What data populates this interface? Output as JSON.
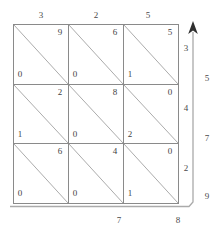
{
  "figure": {
    "type": "lattice-multiplication-grid",
    "rows": 3,
    "cols": 3
  },
  "colors": {
    "grid_line": "#8a8a8a",
    "diagonal_line": "#9a9a9a",
    "text": "#3f3f3f",
    "arrow": "#8a8a8a",
    "background": "#ffffff"
  },
  "top_labels": [
    "3",
    "2",
    "5"
  ],
  "right_inner_labels": [
    "3",
    "4",
    "2"
  ],
  "right_outer_labels": [
    "5",
    "7",
    "9"
  ],
  "bottom_labels": [
    "7",
    "8"
  ],
  "cells": [
    [
      {
        "upper": "9",
        "lower": "0"
      },
      {
        "upper": "6",
        "lower": "0"
      },
      {
        "upper": "5",
        "lower": "1"
      }
    ],
    [
      {
        "upper": "2",
        "lower": "1"
      },
      {
        "upper": "8",
        "lower": "0"
      },
      {
        "upper": "0",
        "lower": "2"
      }
    ],
    [
      {
        "upper": "6",
        "lower": "0"
      },
      {
        "upper": "4",
        "lower": "0"
      },
      {
        "upper": "0",
        "lower": "1"
      }
    ]
  ],
  "arrow": {
    "direction": "up",
    "label": "result-reading-direction"
  }
}
